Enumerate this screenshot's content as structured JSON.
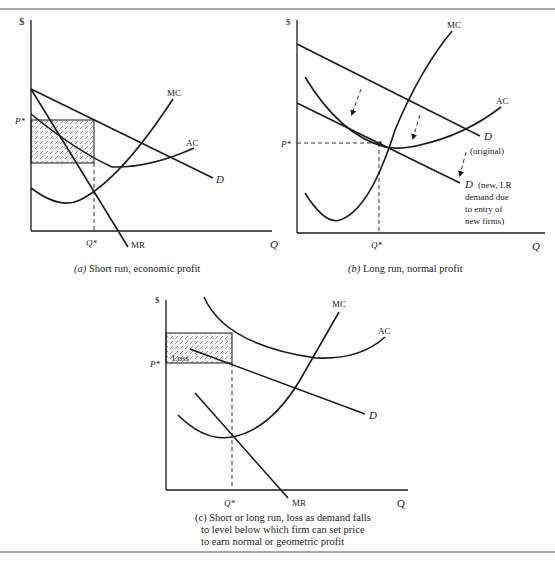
{
  "panels": {
    "a": {
      "y_axis_label": "$",
      "x_axis_label": "Q",
      "price_label": "P*",
      "quantity_label": "Q*",
      "curves": {
        "mc": "MC",
        "ac": "AC",
        "d": "D",
        "mr": "MR"
      },
      "caption_letter": "(a)",
      "caption_text": " Short run, economic profit"
    },
    "b": {
      "y_axis_label": "$",
      "x_axis_label": "Q",
      "price_label": "P*",
      "quantity_label": "Q*",
      "curves": {
        "mc": "MC",
        "ac": "AC",
        "d_original": "D",
        "d_new": "D"
      },
      "d_original_note": "(original)",
      "d_new_note": [
        "(new, LR",
        "demand due",
        "to entry of",
        "new firms)"
      ],
      "caption_letter": "(b)",
      "caption_text": " Long run, normal profit"
    },
    "c": {
      "y_axis_label": "$",
      "x_axis_label": "Q",
      "price_label": "P*",
      "quantity_label": "Q*",
      "loss_label": "Loss",
      "curves": {
        "mc": "MC",
        "ac": "AC",
        "d": "D",
        "mr": "MR"
      },
      "caption_lines": [
        "(c) Short or long run, loss as demand falls",
        "to level below which firm  can set price",
        "to earn normal or  geometric profit"
      ]
    }
  },
  "colors": {
    "ink": "#1a1a1a",
    "hatch": "#555555",
    "rule": "#555555"
  }
}
